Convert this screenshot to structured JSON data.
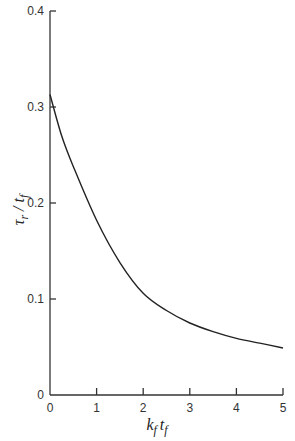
{
  "chart_data": {
    "type": "line",
    "title": "",
    "xlabel": "k_f t_f",
    "ylabel": "τ_r / t_f",
    "xlim": [
      0,
      5
    ],
    "ylim": [
      0,
      0.4
    ],
    "xticks": [
      0,
      1,
      2,
      3,
      4,
      5
    ],
    "yticks": [
      0,
      0.1,
      0.2,
      0.3,
      0.4
    ],
    "xtick_labels": [
      "0",
      "1",
      "2",
      "3",
      "4",
      "5"
    ],
    "ytick_labels": [
      "0",
      "0.1",
      "0.2",
      "0.3",
      "0.4"
    ],
    "grid": false,
    "legend": null,
    "series": [
      {
        "name": "τ_r/t_f",
        "x": [
          0,
          0.25,
          0.5,
          1,
          1.5,
          2,
          2.5,
          3,
          3.5,
          4,
          4.5,
          5
        ],
        "y": [
          0.313,
          0.27,
          0.238,
          0.182,
          0.138,
          0.106,
          0.088,
          0.075,
          0.066,
          0.059,
          0.054,
          0.049
        ]
      }
    ]
  },
  "labels": {
    "xlabel_main": "k",
    "xlabel_sub1": "f",
    "xlabel_t": "t",
    "xlabel_sub2": "f",
    "ylabel_main": "τ",
    "ylabel_sub1": "r",
    "ylabel_slash": " / t",
    "ylabel_sub2": "f"
  }
}
